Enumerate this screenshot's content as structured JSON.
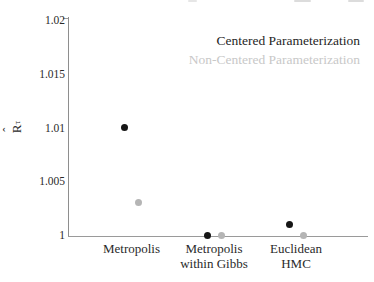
{
  "chart_data": {
    "type": "scatter",
    "categories": [
      "Metropolis",
      "Metropolis within Gibbs",
      "Euclidean HMC"
    ],
    "category_label_lines": [
      [
        "Metropolis"
      ],
      [
        "Metropolis",
        "within Gibbs"
      ],
      [
        "Euclidean",
        "HMC"
      ]
    ],
    "series": [
      {
        "name": "Centered Parameterization",
        "color": "#161616",
        "legend_color": "#1f1f1f",
        "values": [
          1.01,
          1.0,
          1.001
        ]
      },
      {
        "name": "Non-Centered Parameterization",
        "color": "#b5b5b5",
        "legend_color": "#c8c8c8",
        "values": [
          1.003,
          1.0,
          1.0
        ]
      }
    ],
    "title": "",
    "xlabel": "",
    "ylabel": "R̂_τ",
    "ylabel_parts": {
      "hat": "ˆ",
      "base": "R",
      "sub": "τ"
    },
    "ylim": [
      1,
      1.02
    ],
    "yticks": [
      1,
      1.005,
      1.01,
      1.015,
      1.02
    ],
    "ytick_labels": [
      "1",
      "1.005",
      "1.01",
      "1.015",
      "1.02"
    ],
    "grid": false,
    "legend_position": "top-right"
  }
}
